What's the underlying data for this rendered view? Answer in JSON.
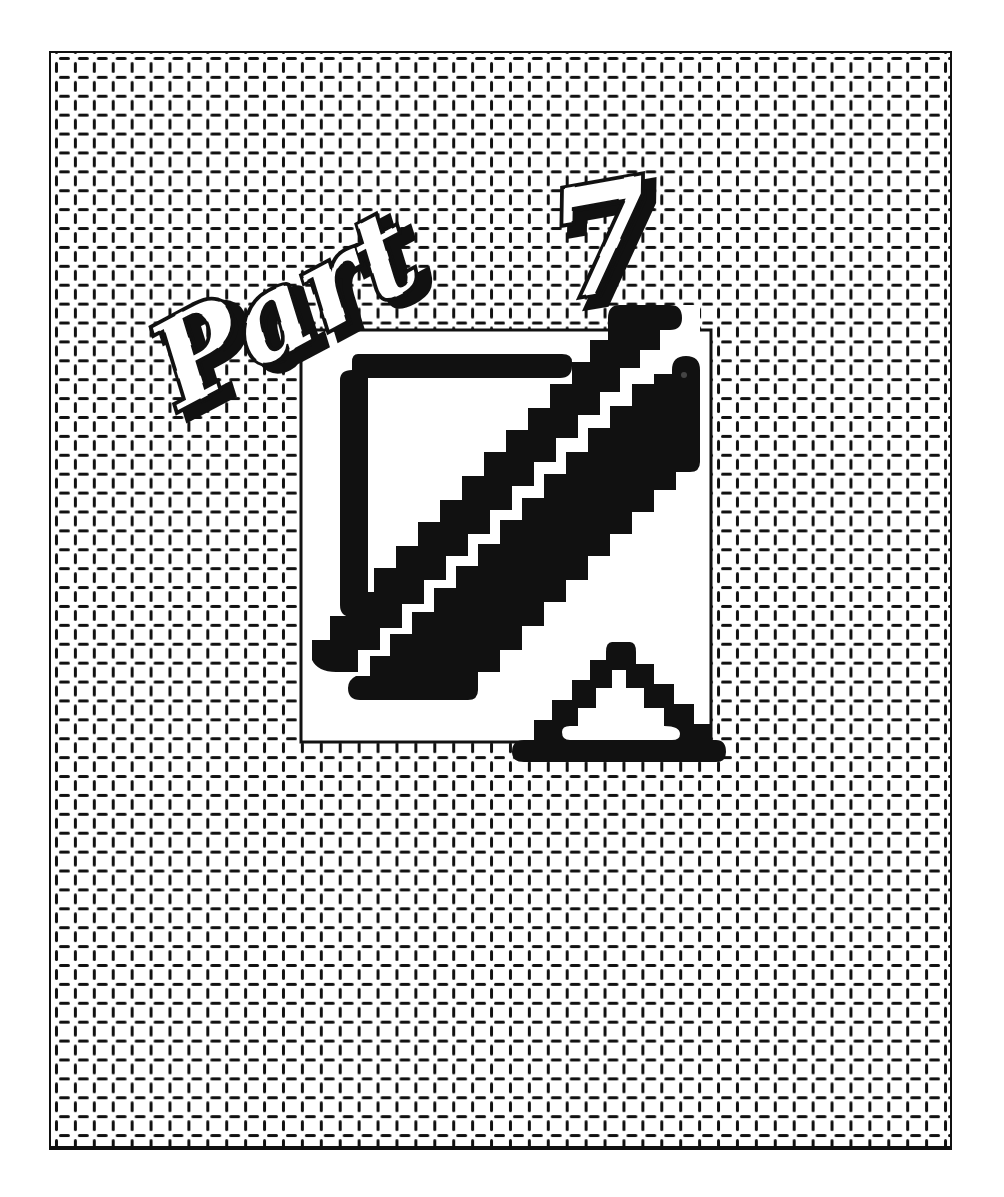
{
  "page": {
    "title": "Part 7",
    "title_word": "Part",
    "title_number": "7"
  },
  "logo": {
    "description": "Stepped diagonal square emblem"
  },
  "colors": {
    "ink": "#111111",
    "paper": "#ffffff"
  }
}
